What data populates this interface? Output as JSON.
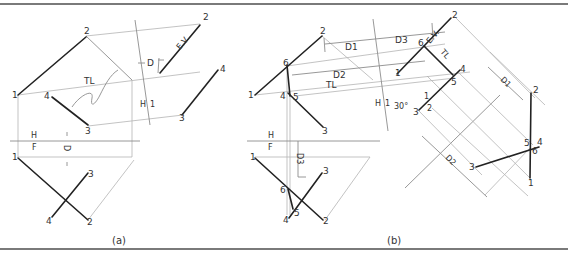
{
  "figure": {
    "panels": [
      {
        "caption": "(a)",
        "fold_lines": {
          "hf_top": "H",
          "hf_bottom": "F",
          "h1_left": "H",
          "h1_right": "1"
        },
        "annotations": {
          "true_length": "TL",
          "edge_view": "E.V.",
          "depth": "D"
        },
        "points_top": [
          "1",
          "2",
          "3",
          "4"
        ],
        "points_front": [
          "1",
          "2",
          "3",
          "4"
        ],
        "points_aux": [
          "2",
          "3",
          "4"
        ]
      },
      {
        "caption": "(b)",
        "fold_lines": {
          "hf_top": "H",
          "hf_bottom": "F",
          "h1_left": "H",
          "h1_right": "1",
          "aux12_top": "1",
          "aux12_bottom": "2"
        },
        "annotations": {
          "true_length": "TL",
          "edge_view": "E.V.",
          "d1": "D1",
          "d2": "D2",
          "d3": "D3",
          "angle": "30°",
          "tl_aux": "TL"
        },
        "points_top": [
          "1",
          "2",
          "3",
          "4",
          "5",
          "6"
        ],
        "points_front": [
          "1",
          "2",
          "3",
          "4",
          "5",
          "6"
        ],
        "points_aux1": [
          "1",
          "2",
          "3",
          "4",
          "5",
          "6"
        ],
        "points_aux2": [
          "1",
          "2",
          "3",
          "4",
          "5",
          "6"
        ]
      }
    ],
    "label_subscripts": {
      "d1": "1",
      "d2": "2",
      "d3": "3"
    }
  }
}
